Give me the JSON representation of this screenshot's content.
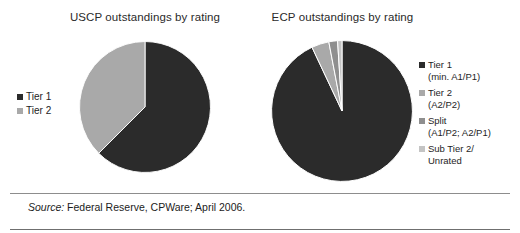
{
  "figure": {
    "width": 520,
    "height": 233,
    "background": "#ffffff"
  },
  "colors": {
    "tier1": "#2b2b2b",
    "tier2": "#a9a9a9",
    "split": "#9a9a9a",
    "sub_tier2_unrated": "#c4c4c4",
    "separator": "#8d8d8d",
    "text": "#1c1c1c"
  },
  "charts": {
    "uscp": {
      "title": "USCP outstandings by rating",
      "legend": [
        {
          "label": "Tier 1",
          "color": "#2b2b2b"
        },
        {
          "label": "Tier 2",
          "color": "#a9a9a9"
        }
      ]
    },
    "ecp": {
      "title": "ECP outstandings by rating",
      "legend": [
        {
          "line1": "Tier 1",
          "line2": "(min. A1/P1)",
          "color": "#2b2b2b"
        },
        {
          "line1": "Tier 2",
          "line2": "(A2/P2)",
          "color": "#a9a9a9"
        },
        {
          "line1": "Split",
          "line2": "(A1/P2; A2/P1)",
          "color": "#8f8f8f"
        },
        {
          "line1": "Sub Tier 2/",
          "line2": "Unrated",
          "color": "#c4c4c4"
        }
      ]
    }
  },
  "footer": {
    "source_label": "Source:",
    "source_text": " Federal Reserve, CPWare; April 2006."
  },
  "chart_data": [
    {
      "type": "pie",
      "id": "uscp",
      "title": "USCP outstandings by rating",
      "labels": [
        "Tier 1",
        "Tier 2"
      ],
      "values": [
        62.5,
        37.5
      ],
      "unit": "percent",
      "start_angle_deg": 0,
      "direction": "clockwise",
      "colors": [
        "#2b2b2b",
        "#a9a9a9"
      ],
      "legend_position": "left",
      "grid": false
    },
    {
      "type": "pie",
      "id": "ecp",
      "title": "ECP outstandings by rating",
      "labels": [
        "Tier 1 (min. A1/P1)",
        "Tier 2 (A2/P2)",
        "Split (A1/P2; A2/P1)",
        "Sub Tier 2/ Unrated"
      ],
      "values": [
        93.0,
        4.0,
        2.0,
        1.0
      ],
      "unit": "percent",
      "start_angle_deg": 0,
      "direction": "clockwise",
      "colors": [
        "#2b2b2b",
        "#a9a9a9",
        "#8f8f8f",
        "#c4c4c4"
      ],
      "legend_position": "right",
      "grid": false
    }
  ]
}
